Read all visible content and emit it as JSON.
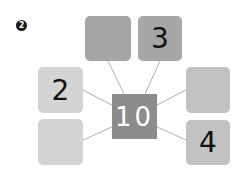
{
  "step_badge": "2",
  "center": {
    "value": "10",
    "color": "#8c8c8c"
  },
  "boxes": [
    {
      "id": "top-left",
      "value": "",
      "color": "#a6a6a6"
    },
    {
      "id": "top-right",
      "value": "3",
      "color": "#a6a6a6"
    },
    {
      "id": "left-top",
      "value": "2",
      "color": "#d4d4d4"
    },
    {
      "id": "left-bottom",
      "value": "",
      "color": "#d4d4d4"
    },
    {
      "id": "right-top",
      "value": "",
      "color": "#c2c2c2"
    },
    {
      "id": "right-bottom",
      "value": "4",
      "color": "#c2c2c2"
    }
  ]
}
